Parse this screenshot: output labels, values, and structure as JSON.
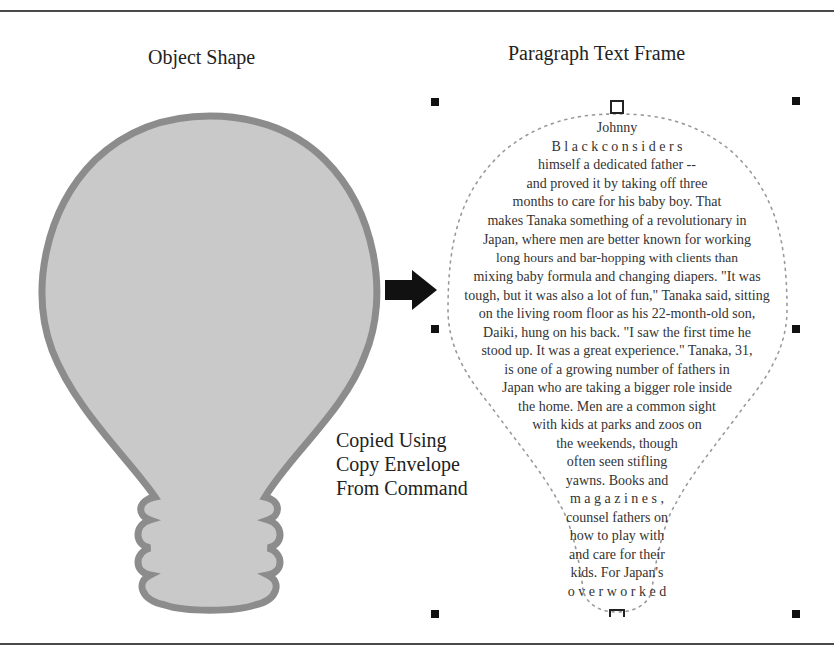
{
  "diagram": {
    "left_panel": {
      "title": "Object Shape",
      "shape": "lightbulb",
      "fill_color": "#c8c8c8",
      "stroke_color": "#8a8a8a"
    },
    "right_panel": {
      "title": "Paragraph Text Frame",
      "frame_outline": "dotted-lightbulb",
      "outline_color": "#9a9a9a",
      "lines": [
        "Johnny",
        "B l a c k   c o n s i d e r s",
        "himself  a  dedicated  father  --",
        "and  proved  it  by  taking  off  three",
        "months  to  care  for  his  baby  boy.  That",
        "makes Tanaka something of a revolutionary in",
        "Japan, where men are better known for working",
        "long   hours   and   bar-hopping   with   clients   than",
        "mixing baby formula and changing diapers. \"It was",
        "tough, but it was also a lot of fun,\" Tanaka said, sitting",
        "on the living room floor as his 22-month-old son,",
        "Daiki, hung on his back. \"I saw the first time he",
        "stood up. It was a great experience.\" Tanaka, 31,",
        "is  one  of  a  growing  number  of  fathers  in",
        "Japan who are taking a bigger role inside",
        "the home. Men are a common sight",
        "with kids at parks and zoos on",
        "the   weekends,   though",
        "often   seen   stifling",
        "yawns. Books and",
        "m a g a z i n e s ,",
        "counsel fathers on",
        "how  to  play  with",
        "and  care  for  their",
        "kids.  For  Japan's",
        "o v e r w o r k e d"
      ]
    },
    "arrow": {
      "direction": "right",
      "color": "#111111"
    },
    "caption": {
      "lines": [
        "Copied Using",
        "Copy Envelope",
        "From Command"
      ]
    },
    "selection_handles": {
      "count": 8,
      "style": "corner-and-edge"
    }
  }
}
